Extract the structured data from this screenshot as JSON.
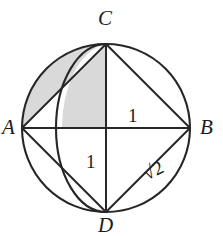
{
  "figure": {
    "type": "geometry-diagram",
    "canvas": {
      "width": 223,
      "height": 236
    },
    "colors": {
      "stroke": "#262626",
      "shade_fill": "#d9d9d9",
      "shade_stroke": "#4a4a4a",
      "background": "#ffffff",
      "label": "#1b1b1b"
    },
    "circle": {
      "name": "circumscribed-circle",
      "center_x": 106,
      "center_y": 128,
      "radius": 84
    },
    "vertices": [
      {
        "id": "A",
        "label": "A",
        "x": 22,
        "y": 128,
        "label_x": 2,
        "label_y": 117
      },
      {
        "id": "B",
        "label": "B",
        "x": 190,
        "y": 128,
        "label_x": 200,
        "label_y": 117
      },
      {
        "id": "C",
        "label": "C",
        "x": 106,
        "y": 44,
        "label_x": 98,
        "label_y": 8
      },
      {
        "id": "D",
        "label": "D",
        "x": 106,
        "y": 212,
        "label_x": 98,
        "label_y": 215
      }
    ],
    "segments": [
      {
        "name": "segment-AB",
        "from": "A",
        "to": "B"
      },
      {
        "name": "segment-CD",
        "from": "C",
        "to": "D"
      },
      {
        "name": "segment-AC",
        "from": "A",
        "to": "C"
      },
      {
        "name": "segment-CB",
        "from": "C",
        "to": "B"
      },
      {
        "name": "segment-AD",
        "from": "A",
        "to": "D"
      },
      {
        "name": "segment-DB",
        "from": "D",
        "to": "B"
      }
    ],
    "inner_arc": {
      "name": "semicircle-arc-C-to-D",
      "from": "C",
      "to": "D",
      "bulge_direction": "left",
      "leftmost_x": 62,
      "leftmost_y": 128
    },
    "measure_labels": [
      {
        "name": "length-label-CB",
        "text": "1",
        "x": 128,
        "y": 106,
        "rotation": 0
      },
      {
        "name": "length-label-OD",
        "text": "1",
        "x": 86,
        "y": 152,
        "rotation": 0
      },
      {
        "name": "length-label-DB",
        "text": "√2",
        "x": 140,
        "y": 166,
        "rotation": -26
      }
    ],
    "shaded_regions": [
      {
        "name": "shaded-lune-upper-left",
        "description": "Region bounded by the circle arc from A to C and the inner semicircular arc from C toward A, plus the quadrant strip between the inner arc and segment CO",
        "fill": "#d9d9d9"
      }
    ]
  }
}
